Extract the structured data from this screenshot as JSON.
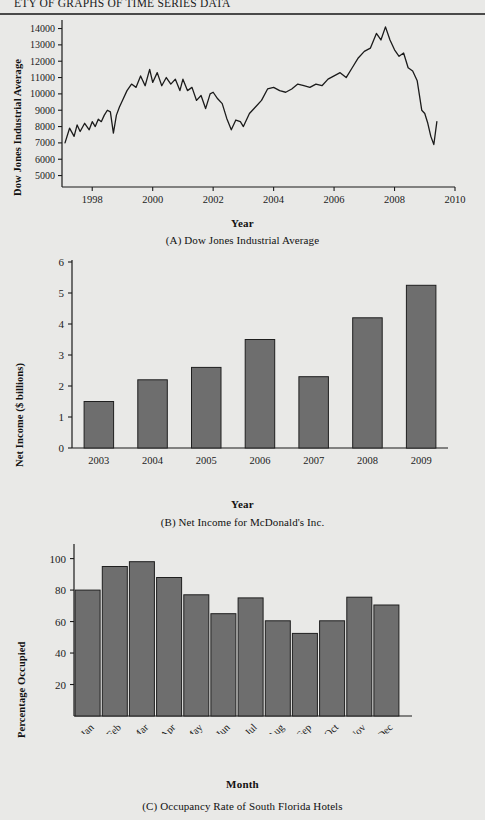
{
  "page": {
    "running_head": "ETY OF GRAPHS OF TIME SERIES DATA",
    "background_color": "#e9e9e7",
    "rule_color": "#4a4a4a"
  },
  "figures": [
    {
      "id": "figure-a",
      "caption": "(A) Dow Jones Industrial Average",
      "chart_key": "0"
    },
    {
      "id": "figure-b",
      "caption": "(B) Net Income for McDonald's Inc.",
      "chart_key": "1"
    },
    {
      "id": "figure-c",
      "caption": "(C) Occupancy Rate of South Florida Hotels",
      "chart_key": "2"
    }
  ],
  "chart_data": [
    {
      "type": "line",
      "title": "",
      "caption": "(A) Dow Jones Industrial Average",
      "xlabel": "Year",
      "ylabel": "Dow Jones Industrial Average",
      "xlim": [
        1997.0,
        2010.0
      ],
      "ylim": [
        4300,
        14400
      ],
      "xticks": [
        1998,
        2000,
        2002,
        2004,
        2006,
        2008,
        2010
      ],
      "yticks": [
        5000,
        6000,
        7000,
        8000,
        9000,
        10000,
        11000,
        12000,
        13000,
        14000
      ],
      "grid": false,
      "legend": "none",
      "line_color": "#1b1b1b",
      "x": [
        1997.1,
        1997.25,
        1997.4,
        1997.5,
        1997.6,
        1997.75,
        1997.9,
        1998.0,
        1998.1,
        1998.2,
        1998.3,
        1998.4,
        1998.5,
        1998.6,
        1998.7,
        1998.8,
        1998.9,
        1999.0,
        1999.15,
        1999.3,
        1999.45,
        1999.6,
        1999.75,
        1999.9,
        2000.0,
        2000.15,
        2000.3,
        2000.45,
        2000.6,
        2000.75,
        2000.9,
        2001.0,
        2001.15,
        2001.3,
        2001.45,
        2001.6,
        2001.75,
        2001.9,
        2002.0,
        2002.15,
        2002.3,
        2002.45,
        2002.6,
        2002.75,
        2002.9,
        2003.0,
        2003.2,
        2003.4,
        2003.6,
        2003.8,
        2004.0,
        2004.2,
        2004.4,
        2004.6,
        2004.8,
        2005.0,
        2005.2,
        2005.4,
        2005.6,
        2005.8,
        2006.0,
        2006.2,
        2006.4,
        2006.6,
        2006.8,
        2007.0,
        2007.2,
        2007.4,
        2007.55,
        2007.7,
        2007.85,
        2008.0,
        2008.15,
        2008.3,
        2008.45,
        2008.6,
        2008.75,
        2008.9,
        2009.0,
        2009.1,
        2009.2,
        2009.3,
        2009.4
      ],
      "y": [
        7000,
        7900,
        7400,
        8100,
        7700,
        8200,
        7800,
        8300,
        8000,
        8450,
        8300,
        8700,
        9000,
        8900,
        7600,
        8700,
        9200,
        9600,
        10200,
        10600,
        10400,
        11100,
        10500,
        11500,
        10700,
        11300,
        10500,
        11000,
        10600,
        10900,
        10200,
        10900,
        10200,
        10400,
        9600,
        9900,
        9100,
        10000,
        10100,
        9700,
        9400,
        8500,
        7800,
        8400,
        8300,
        8000,
        8800,
        9200,
        9600,
        10300,
        10400,
        10200,
        10100,
        10300,
        10600,
        10500,
        10400,
        10600,
        10500,
        10900,
        11100,
        11300,
        11000,
        11600,
        12200,
        12600,
        12800,
        13700,
        13300,
        14100,
        13300,
        12700,
        12300,
        12500,
        11600,
        11400,
        10800,
        9000,
        8800,
        8200,
        7400,
        6900,
        8300
      ]
    },
    {
      "type": "bar",
      "title": "",
      "caption": "(B) Net Income for McDonald's Inc.",
      "xlabel": "Year",
      "ylabel": "Net Income ($ billions)",
      "categories": [
        "2003",
        "2004",
        "2005",
        "2006",
        "2007",
        "2008",
        "2009"
      ],
      "values": [
        1.5,
        2.2,
        2.6,
        3.5,
        2.3,
        4.2,
        5.25
      ],
      "ylim": [
        0,
        6
      ],
      "yticks": [
        0,
        1,
        2,
        3,
        4,
        5,
        6
      ],
      "grid": false,
      "legend": "none",
      "bar_color": "#6e6e6e",
      "bar_edge_color": "#1f1f1f"
    },
    {
      "type": "bar",
      "title": "",
      "caption": "(C) Occupancy Rate of South Florida Hotels",
      "xlabel": "Month",
      "ylabel": "Percentage Occupied",
      "categories": [
        "Jan",
        "Feb",
        "Mar",
        "Apr",
        "May",
        "Jun",
        "Jul",
        "Aug",
        "Sep",
        "Oct",
        "Nov",
        "Dec"
      ],
      "values": [
        80,
        95,
        98,
        88,
        77,
        65,
        75,
        60.5,
        52.5,
        60.5,
        75.5,
        70.5
      ],
      "ylim": [
        0,
        108
      ],
      "yticks": [
        20,
        40,
        60,
        80,
        100
      ],
      "grid": false,
      "legend": "none",
      "bar_color": "#6e6e6e",
      "bar_edge_color": "#1f1f1f"
    }
  ]
}
